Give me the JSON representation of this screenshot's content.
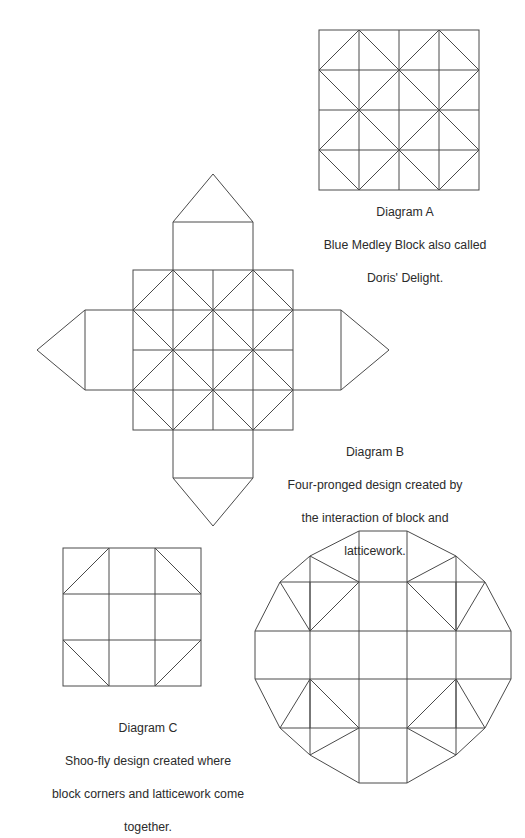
{
  "page": {
    "width": 525,
    "height": 783,
    "background_color": "#ffffff",
    "line_color": "#4a4a4a",
    "text_color": "#2b2b2b"
  },
  "figures": [
    {
      "id": "A",
      "name": "diagram-a-blue-medley-block",
      "type": "quilt-block",
      "description": "Square pieced quilt block with star and diamond patchwork",
      "size_px": 160,
      "grid_divisions": 4,
      "caption": {
        "title": "Diagram A",
        "body": "Blue Medley Block also called\nDoris' Delight."
      }
    },
    {
      "id": "B",
      "name": "diagram-b-four-pronged-design",
      "type": "quilt-block-with-prongs",
      "description": "Same pieced block with four rectangular prongs ending in points, one on each side",
      "block_size_px": 160,
      "prong_count": 4,
      "prong_shaft_length_px": 48,
      "prong_point_length_px": 40,
      "caption": {
        "title": "Diagram B",
        "body": "Four-pronged design created by\nthe interaction of block and\nlatticework."
      }
    },
    {
      "id": "C",
      "name": "diagram-c-shoo-fly-block",
      "type": "quilt-block",
      "description": "Shoo-fly block: three by three grid with half-square triangles in the four corners",
      "size_px": 138,
      "grid_divisions": 3,
      "caption": {
        "title": "Diagram C",
        "body": "Shoo-fly design created where\nblock corners and latticework come\ntogether."
      }
    },
    {
      "id": "D",
      "name": "diagram-d-combined-octagon-layout",
      "type": "combined-quilt-layout",
      "description": "Twelve-sided combined layout: central pieced block with four prongs and shoo-fly corner triangles",
      "size_px": 258,
      "caption": null
    }
  ],
  "captions": {
    "a": {
      "title": "Diagram A",
      "line1": "Blue Medley Block also called",
      "line2": "Doris' Delight."
    },
    "b": {
      "title": "Diagram B",
      "line1": "Four-pronged design created by",
      "line2": "the interaction of block and",
      "line3": "latticework."
    },
    "c": {
      "title": "Diagram C",
      "line1": "Shoo-fly design created where",
      "line2": "block corners and latticework come",
      "line3": "together."
    }
  }
}
